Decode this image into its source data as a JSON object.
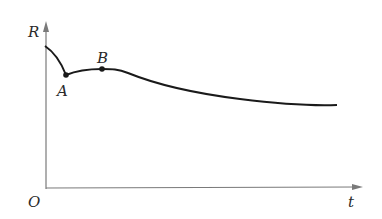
{
  "diagram": {
    "axis_y_label": "R",
    "axis_x_label": "t",
    "origin_label": "O",
    "points": [
      {
        "label": "A",
        "x": 66,
        "y": 75
      },
      {
        "label": "B",
        "x": 102,
        "y": 69
      }
    ],
    "colors": {
      "curve": "#1a1a1a",
      "axis": "#7a7a7a",
      "text": "#2a2a2a"
    }
  }
}
